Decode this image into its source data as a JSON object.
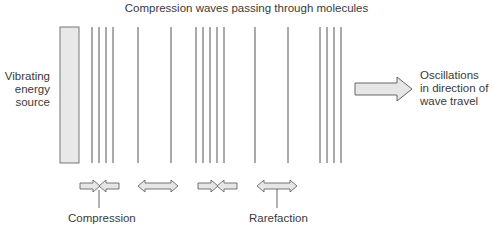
{
  "title": "Compression waves passing through molecules",
  "source_label": [
    "Vibrating",
    "energy",
    "source"
  ],
  "direction_label": [
    "Oscillations",
    "in direction of",
    "wave travel"
  ],
  "annotations": {
    "compression": "Compression",
    "rarefaction": "Rarefaction"
  },
  "colors": {
    "line": "#555555",
    "arrow_fill": "#e6e6e6",
    "source_fill": "#e8e8e8"
  },
  "molecule_lines_x": [
    92,
    99,
    106,
    113,
    138,
    171,
    196,
    203,
    210,
    217,
    224,
    255,
    288,
    320,
    327,
    334,
    341
  ],
  "zones": [
    {
      "type": "compression",
      "center_x": 99
    },
    {
      "type": "rarefaction",
      "center_x": 158
    },
    {
      "type": "compression",
      "center_x": 218
    },
    {
      "type": "rarefaction",
      "center_x": 277
    }
  ]
}
